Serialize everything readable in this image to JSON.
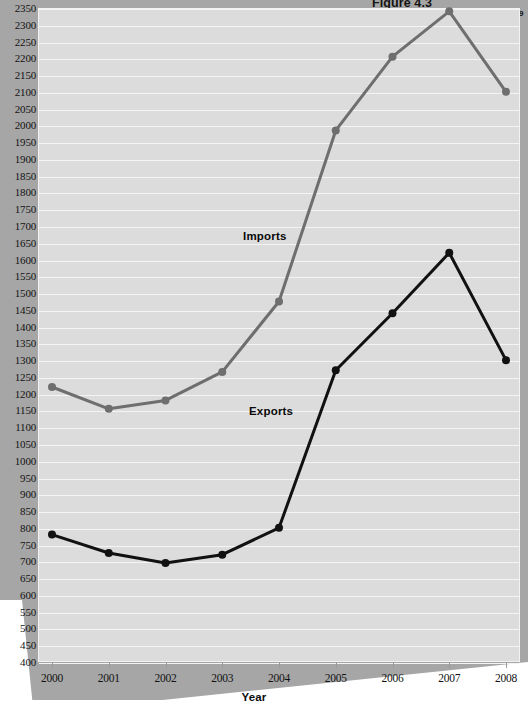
{
  "figure": {
    "number": "Figure 4.3",
    "title": "U.S. Imports and Exports",
    "title_superscript": "9"
  },
  "axis": {
    "x_title": "Year",
    "y_ticks": [
      400,
      450,
      500,
      550,
      600,
      650,
      700,
      750,
      800,
      850,
      900,
      950,
      1000,
      1050,
      1100,
      1150,
      1200,
      1250,
      1300,
      1350,
      1400,
      1450,
      1500,
      1550,
      1600,
      1650,
      1700,
      1750,
      1800,
      1850,
      1900,
      1950,
      2000,
      2050,
      2100,
      2150,
      2200,
      2250,
      2300,
      2350
    ],
    "x_ticks": [
      "2000",
      "2001",
      "2002",
      "2003",
      "2004",
      "2005",
      "2006",
      "2007",
      "2008"
    ]
  },
  "series_labels": {
    "imports": "Imports",
    "exports": "Exports"
  },
  "colors": {
    "imports_line": "#6e6e6e",
    "exports_line": "#111111",
    "plot_background": "#dcdcdc",
    "page_background": "#a6a6a6",
    "gridline": "#f4f4f4"
  },
  "chart_data": {
    "type": "line",
    "title": "U.S. Imports and Exports",
    "xlabel": "Year",
    "ylabel": "",
    "x": [
      2000,
      2001,
      2002,
      2003,
      2004,
      2005,
      2006,
      2007,
      2008
    ],
    "xlim": [
      2000,
      2008
    ],
    "ylim": [
      400,
      2350
    ],
    "grid": true,
    "legend": "inline-labels",
    "series": [
      {
        "name": "Imports",
        "color": "#6e6e6e",
        "values": [
          1220,
          1155,
          1180,
          1265,
          1475,
          1985,
          2205,
          2340,
          2100
        ]
      },
      {
        "name": "Exports",
        "color": "#111111",
        "values": [
          780,
          725,
          695,
          720,
          800,
          1270,
          1440,
          1620,
          1300
        ]
      }
    ]
  }
}
